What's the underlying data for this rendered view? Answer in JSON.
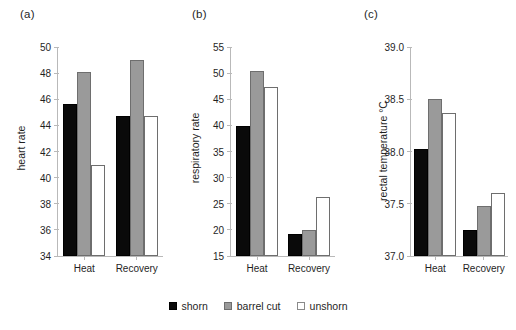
{
  "figure": {
    "background": "#ffffff",
    "panel_tags": [
      "(a)",
      "(b)",
      "(c)"
    ]
  },
  "legend": {
    "position": "bottom-center",
    "entries": [
      {
        "label": "shorn",
        "color": "#0a0a0a",
        "swatch": "shorn"
      },
      {
        "label": "barrel cut",
        "color": "#9a9a9a",
        "swatch": "barrel"
      },
      {
        "label": "unshorn",
        "color": "#ffffff",
        "swatch": "unshorn"
      }
    ]
  },
  "chart_data": [
    {
      "type": "bar",
      "panel": "(a)",
      "title": "",
      "xlabel": "",
      "ylabel": "heart rate",
      "categories": [
        "Heat",
        "Recovery"
      ],
      "series": [
        {
          "name": "shorn",
          "color": "#0a0a0a",
          "values": [
            45.6,
            44.7
          ]
        },
        {
          "name": "barrel cut",
          "color": "#9a9a9a",
          "values": [
            48.1,
            49.0
          ]
        },
        {
          "name": "unshorn",
          "color": "#ffffff",
          "values": [
            41.0,
            44.7
          ]
        }
      ],
      "ylim": [
        34,
        50
      ],
      "yticks": [
        34,
        36,
        38,
        40,
        42,
        44,
        46,
        48,
        50
      ],
      "ytick_labels": [
        "34",
        "36",
        "38",
        "40",
        "42",
        "44",
        "46",
        "48",
        "50"
      ],
      "grid": false,
      "legend": "bottom"
    },
    {
      "type": "bar",
      "panel": "(b)",
      "title": "",
      "xlabel": "",
      "ylabel": "respiratory rate",
      "categories": [
        "Heat",
        "Recovery"
      ],
      "series": [
        {
          "name": "shorn",
          "color": "#0a0a0a",
          "values": [
            39.8,
            19.2
          ]
        },
        {
          "name": "barrel cut",
          "color": "#9a9a9a",
          "values": [
            50.4,
            20.0
          ]
        },
        {
          "name": "unshorn",
          "color": "#ffffff",
          "values": [
            47.4,
            26.3
          ]
        }
      ],
      "ylim": [
        15,
        55
      ],
      "yticks": [
        15,
        20,
        25,
        30,
        35,
        40,
        45,
        50,
        55
      ],
      "ytick_labels": [
        "15",
        "20",
        "25",
        "30",
        "35",
        "40",
        "45",
        "50",
        "55"
      ],
      "grid": false,
      "legend": "bottom"
    },
    {
      "type": "bar",
      "panel": "(c)",
      "title": "",
      "xlabel": "",
      "ylabel": "rectal temperature °C",
      "categories": [
        "Heat",
        "Recovery"
      ],
      "series": [
        {
          "name": "shorn",
          "color": "#0a0a0a",
          "values": [
            38.02,
            37.25
          ]
        },
        {
          "name": "barrel cut",
          "color": "#9a9a9a",
          "values": [
            38.5,
            37.48
          ]
        },
        {
          "name": "unshorn",
          "color": "#ffffff",
          "values": [
            38.37,
            37.6
          ]
        }
      ],
      "ylim": [
        37.0,
        39.0
      ],
      "yticks": [
        37.0,
        37.5,
        38.0,
        38.5,
        39.0
      ],
      "ytick_labels": [
        "37.0",
        "37.5",
        "38.0",
        "38.5",
        "39.0"
      ],
      "grid": false,
      "legend": "bottom"
    }
  ]
}
